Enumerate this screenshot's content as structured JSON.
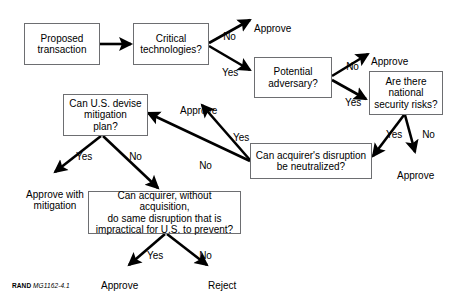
{
  "figure": {
    "caption_brand": "RAND",
    "caption_code": "MG1162-4.1"
  },
  "nodes": [
    {
      "id": "proposed-transaction",
      "text": "Proposed\ntransaction"
    },
    {
      "id": "critical-technologies",
      "text": "Critical\ntechnologies?"
    },
    {
      "id": "potential-adversary",
      "text": "Potential\nadversary?"
    },
    {
      "id": "national-security-risks",
      "text": "Are there\nnational\nsecurity risks?"
    },
    {
      "id": "acquirer-disruption-neutralized",
      "text": "Can acquirer's disruption\nbe neutralized?"
    },
    {
      "id": "us-devise-mitigation-plan",
      "text": "Can U.S. devise\nmitigation\nplan?"
    },
    {
      "id": "acquirer-without-acquisition",
      "text": "Can acquirer, without acquisition,\ndo same disruption that is\nimpractical for U.S. to prevent?"
    }
  ],
  "terminals": [
    {
      "id": "approve-critical-no",
      "text": "Approve"
    },
    {
      "id": "approve-adversary-no",
      "text": "Approve"
    },
    {
      "id": "approve-risks-no",
      "text": "Approve"
    },
    {
      "id": "approve-neutralized-yes",
      "text": "Approve"
    },
    {
      "id": "approve-with-mitigation",
      "text": "Approve with\nmitigation"
    },
    {
      "id": "approve-impractical-yes",
      "text": "Approve"
    },
    {
      "id": "reject-impractical-no",
      "text": "Reject"
    }
  ],
  "edge_labels": [
    {
      "id": "critical-no",
      "text": "No"
    },
    {
      "id": "critical-yes",
      "text": "Yes"
    },
    {
      "id": "adversary-no",
      "text": "No"
    },
    {
      "id": "adversary-yes",
      "text": "Yes"
    },
    {
      "id": "risks-yes",
      "text": "Yes"
    },
    {
      "id": "risks-no",
      "text": "No"
    },
    {
      "id": "neutralized-yes",
      "text": "Yes"
    },
    {
      "id": "neutralized-no",
      "text": "No"
    },
    {
      "id": "mitigation-yes",
      "text": "Yes"
    },
    {
      "id": "mitigation-no",
      "text": "No"
    },
    {
      "id": "impractical-yes",
      "text": "Yes"
    },
    {
      "id": "impractical-no",
      "text": "No"
    }
  ],
  "colors": {
    "box_border": "#6d6e71",
    "arrow": "#000000",
    "background": "#ffffff",
    "text": "#000000"
  }
}
